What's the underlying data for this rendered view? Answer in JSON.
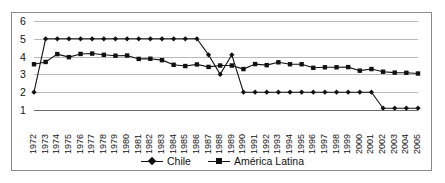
{
  "chart_data": {
    "type": "line",
    "title": "",
    "subtitle": "",
    "xlabel": "",
    "ylabel": "",
    "ylim": [
      1,
      6
    ],
    "yticks": [
      1,
      2,
      3,
      4,
      5,
      6
    ],
    "ytick_labels": [
      "1",
      "2",
      "3",
      "4",
      "5",
      "6"
    ],
    "grid": true,
    "legend_position": "bottom-center",
    "categories": [
      "1972",
      "1973",
      "1974",
      "1975",
      "1976",
      "1977",
      "1978",
      "1979",
      "1980",
      "1981",
      "1982",
      "1983",
      "1984",
      "1985",
      "1986",
      "1987",
      "1988",
      "1989",
      "1990",
      "1991",
      "1992",
      "1993",
      "1994",
      "1995",
      "1996",
      "1997",
      "1998",
      "1999",
      "2000",
      "2001",
      "2002",
      "2003",
      "2004",
      "2005"
    ],
    "series": [
      {
        "name": "Chile",
        "marker": "diamond",
        "color": "#111111",
        "values": [
          2.0,
          5.0,
          5.0,
          5.0,
          5.0,
          5.0,
          5.0,
          5.0,
          5.0,
          5.0,
          5.0,
          5.0,
          5.0,
          5.0,
          5.0,
          4.1,
          3.0,
          4.1,
          2.0,
          2.0,
          2.0,
          2.0,
          2.0,
          2.0,
          2.0,
          2.0,
          2.0,
          2.0,
          2.0,
          2.0,
          1.1,
          1.1,
          1.1,
          1.1
        ]
      },
      {
        "name": "América Latina",
        "marker": "square",
        "color": "#111111",
        "values": [
          3.57,
          3.7,
          4.14,
          3.97,
          4.15,
          4.17,
          4.1,
          4.05,
          4.06,
          3.87,
          3.88,
          3.8,
          3.54,
          3.47,
          3.56,
          3.42,
          3.5,
          3.5,
          3.3,
          3.58,
          3.52,
          3.68,
          3.57,
          3.57,
          3.37,
          3.4,
          3.4,
          3.41,
          3.21,
          3.3,
          3.15,
          3.1,
          3.09,
          3.05
        ]
      }
    ]
  },
  "legend": {
    "items": [
      {
        "label": "Chile",
        "marker": "diamond"
      },
      {
        "label": "América Latina",
        "marker": "square"
      }
    ]
  }
}
